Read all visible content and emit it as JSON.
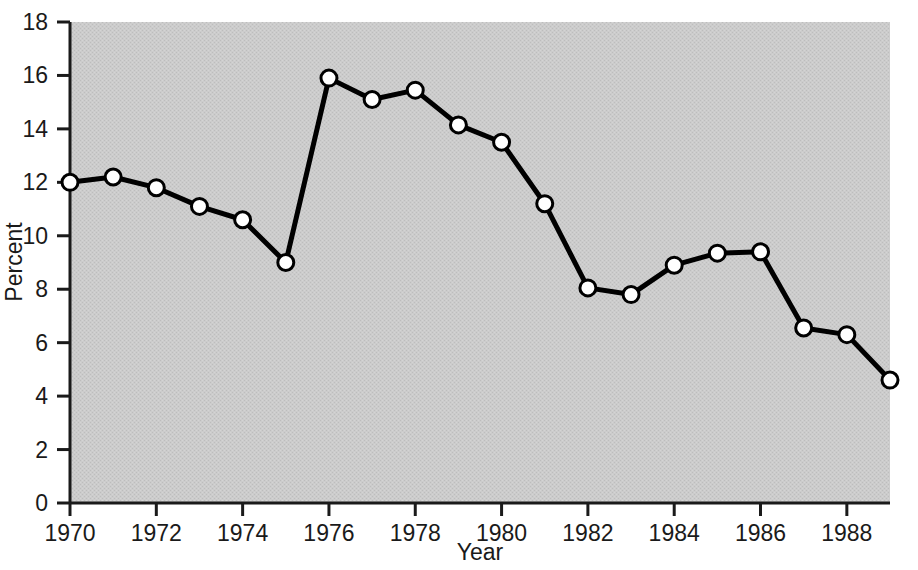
{
  "chart_data": {
    "type": "line",
    "title": "",
    "xlabel": "Year",
    "ylabel": "Percent",
    "x": [
      1970,
      1971,
      1972,
      1973,
      1974,
      1975,
      1976,
      1977,
      1978,
      1979,
      1980,
      1981,
      1982,
      1983,
      1984,
      1985,
      1986,
      1987,
      1988,
      1989
    ],
    "values": [
      12.0,
      12.2,
      11.8,
      11.1,
      10.6,
      9.0,
      15.9,
      15.1,
      15.45,
      14.15,
      13.5,
      11.2,
      8.05,
      7.8,
      8.9,
      9.35,
      9.4,
      6.55,
      6.3,
      4.6
    ],
    "xlim": [
      1970,
      1989
    ],
    "ylim": [
      0,
      18
    ],
    "xtick_labels": [
      "1970",
      "1972",
      "1974",
      "1976",
      "1978",
      "1980",
      "1982",
      "1984",
      "1986",
      "1988"
    ],
    "xticks": [
      1970,
      1972,
      1974,
      1976,
      1978,
      1980,
      1982,
      1984,
      1986,
      1988
    ],
    "ytick_labels": [
      "0",
      "2",
      "4",
      "6",
      "8",
      "10",
      "12",
      "14",
      "16",
      "18"
    ],
    "yticks": [
      0,
      2,
      4,
      6,
      8,
      10,
      12,
      14,
      16,
      18
    ],
    "grid": false,
    "legend": null,
    "marker": "circle-open-white",
    "line_color": "#000000",
    "marker_face_color": "#ffffff",
    "marker_edge_color": "#000000",
    "plot_background_color": "#c9c9c9",
    "figure_background_color": "#ffffff",
    "axis_color": "#1a1a1a"
  }
}
